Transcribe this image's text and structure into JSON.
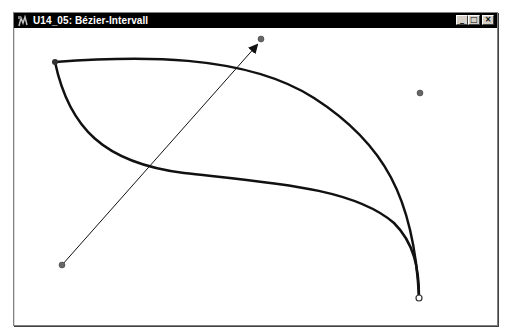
{
  "window": {
    "title": "U14_05: Bézier-Intervall",
    "app_icon": "app-icon",
    "controls": {
      "minimize": "_",
      "maximize": "□",
      "close": "×"
    }
  },
  "canvas": {
    "curve_color": "#111111",
    "handle_color": "#555555",
    "start_point": {
      "x": 41,
      "y": 34
    },
    "end_point": {
      "x": 405,
      "y": 269
    },
    "control_points": [
      {
        "name": "control-point-1",
        "x": 247,
        "y": 11
      },
      {
        "name": "control-point-2",
        "x": 406,
        "y": 65
      },
      {
        "name": "control-point-3",
        "x": 48,
        "y": 237
      }
    ],
    "tangent_arrow": {
      "from": {
        "x": 48,
        "y": 237
      },
      "to": {
        "x": 245,
        "y": 14
      }
    }
  }
}
